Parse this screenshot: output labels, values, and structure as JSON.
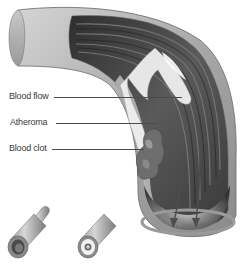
{
  "figure": {
    "colors": {
      "background": "#ffffff",
      "vessel_wall_outer": "#b8b8b8",
      "vessel_wall_inner": "#8c8c8c",
      "lumen_dark": "#3c3c3c",
      "atheroma": "#e8e8e8",
      "clot": "#6a6a6a",
      "label_text": "#3a3a3a",
      "leader_line": "#4a4a4a"
    },
    "labels": [
      {
        "id": "blood-flow",
        "text": "Blood flow"
      },
      {
        "id": "atheroma",
        "text": "Atheroma"
      },
      {
        "id": "blood-clot",
        "text": "Blood clot"
      }
    ],
    "small_vessels": [
      {
        "id": "healthy-vessel",
        "description": "Open vessel cross-section"
      },
      {
        "id": "narrowed-vessel",
        "description": "Vessel with narrowed lumen"
      }
    ]
  }
}
